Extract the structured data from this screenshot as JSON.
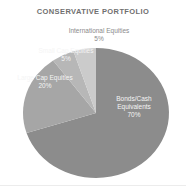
{
  "chart_data": {
    "type": "pie",
    "title": "CONSERVATIVE PORTFOLIO",
    "legend": "none",
    "labels_on_chart": true,
    "start_angle_deg": 0,
    "direction": "clockwise",
    "slices": [
      {
        "name": "Bonds/Cash Equivalents",
        "label_lines": [
          "Bonds/Cash",
          "Equivalents"
        ],
        "value": 70,
        "pct_text": "70%",
        "color": "#8c8c8c"
      },
      {
        "name": "Large Cap Equities",
        "value": 20,
        "pct_text": "20%",
        "color": "#a6a6a6"
      },
      {
        "name": "Small Cap Equities",
        "value": 5,
        "pct_text": "5%",
        "color": "#b7b7b7"
      },
      {
        "name": "International Equities",
        "value": 5,
        "pct_text": "5%",
        "color": "#cbcbcb"
      }
    ]
  }
}
